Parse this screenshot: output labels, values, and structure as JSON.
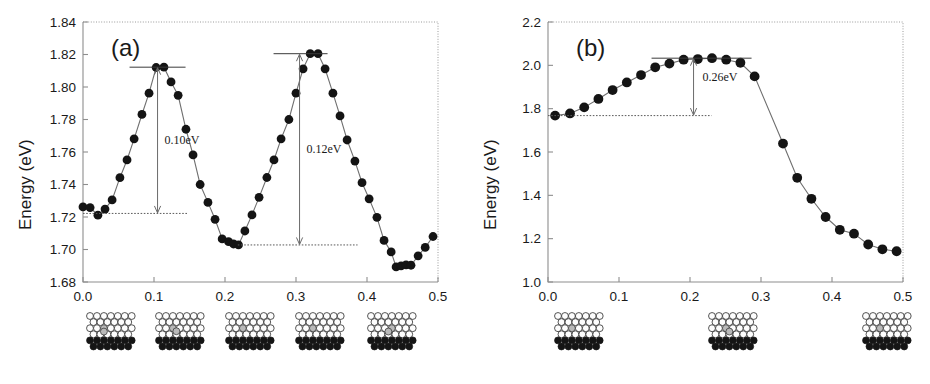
{
  "figure": {
    "panel_count": 2
  },
  "panels": {
    "a": {
      "tag": "(a)",
      "ylabel": "Energy (eV)",
      "xlabel": "",
      "yticks": [
        "1.68",
        "1.70",
        "1.72",
        "1.74",
        "1.76",
        "1.78",
        "1.80",
        "1.82",
        "1.84"
      ],
      "xticks": [
        "0.0",
        "0.1",
        "0.2",
        "0.3",
        "0.4",
        "0.5"
      ],
      "annotations": [
        {
          "label": "0.10eV",
          "x": 0.105,
          "top": 1.8122,
          "bottom": 1.7222
        },
        {
          "label": "0.12eV",
          "x": 0.305,
          "top": 1.8205,
          "bottom": 1.7028
        }
      ],
      "inset_count": 5,
      "inset_labels": [
        "structure-0.00",
        "structure-0.11",
        "structure-0.22",
        "structure-0.33",
        "structure-0.46"
      ]
    },
    "b": {
      "tag": "(b)",
      "ylabel": "Energy (eV)",
      "xlabel": "",
      "yticks": [
        "1.0",
        "1.2",
        "1.4",
        "1.6",
        "1.8",
        "2.0",
        "2.2"
      ],
      "xticks": [
        "0.0",
        "0.1",
        "0.2",
        "0.3",
        "0.4",
        "0.5"
      ],
      "annotations": [
        {
          "label": "0.26eV",
          "x": 0.205,
          "top": 2.033,
          "bottom": 1.768
        }
      ],
      "inset_count": 3,
      "inset_labels": [
        "structure-0.01",
        "structure-0.21",
        "structure-0.49"
      ]
    }
  },
  "colors": {
    "marker": "#141414",
    "curve": "#6f6f6f",
    "frame": "#8e8e8e",
    "text": "#1a1a1a",
    "atom_top": "#fdfdfd",
    "atom_bottom": "#151515",
    "atom_highlight": "#b9b9b9"
  },
  "chart_data": [
    {
      "type": "scatter",
      "panel": "a",
      "title": "(a)",
      "xlabel": "",
      "ylabel": "Energy (eV)",
      "xlim": [
        0.0,
        0.5
      ],
      "ylim": [
        1.68,
        1.84
      ],
      "xticks": [
        0.0,
        0.1,
        0.2,
        0.3,
        0.4,
        0.5
      ],
      "yticks": [
        1.68,
        1.7,
        1.72,
        1.74,
        1.76,
        1.78,
        1.8,
        1.82,
        1.84
      ],
      "grid": false,
      "legend": "none",
      "markers": "filled-circle",
      "connected": true,
      "x": [
        0.0,
        0.01,
        0.021,
        0.031,
        0.041,
        0.052,
        0.062,
        0.072,
        0.083,
        0.093,
        0.103,
        0.114,
        0.124,
        0.134,
        0.145,
        0.155,
        0.165,
        0.176,
        0.186,
        0.196,
        0.205,
        0.212,
        0.219,
        0.228,
        0.238,
        0.248,
        0.259,
        0.269,
        0.279,
        0.29,
        0.3,
        0.31,
        0.32,
        0.331,
        0.341,
        0.352,
        0.362,
        0.372,
        0.383,
        0.393,
        0.403,
        0.414,
        0.424,
        0.434,
        0.441,
        0.448,
        0.455,
        0.462,
        0.472,
        0.482,
        0.493
      ],
      "y": [
        1.7262,
        1.7258,
        1.7211,
        1.7249,
        1.7305,
        1.7442,
        1.7551,
        1.7681,
        1.7831,
        1.7962,
        1.812,
        1.8122,
        1.8031,
        1.7949,
        1.774,
        1.7582,
        1.74,
        1.729,
        1.7186,
        1.7065,
        1.7048,
        1.7034,
        1.7028,
        1.7114,
        1.7213,
        1.7321,
        1.7443,
        1.7551,
        1.7681,
        1.78,
        1.7962,
        1.8112,
        1.8205,
        1.8205,
        1.8112,
        1.7962,
        1.7822,
        1.7674,
        1.7544,
        1.7411,
        1.7312,
        1.7198,
        1.7056,
        1.6985,
        1.6893,
        1.6899,
        1.6905,
        1.6903,
        1.6961,
        1.7013,
        1.708
      ],
      "annotations": [
        {
          "text": "0.10eV",
          "barrier": 0.1,
          "from": 1.7222,
          "to": 1.8122
        },
        {
          "text": "0.12eV",
          "barrier": 0.12,
          "from": 1.7028,
          "to": 1.8205
        }
      ]
    },
    {
      "type": "scatter",
      "panel": "b",
      "title": "(b)",
      "xlabel": "",
      "ylabel": "Energy (eV)",
      "xlim": [
        0.0,
        0.5
      ],
      "ylim": [
        1.0,
        2.2
      ],
      "xticks": [
        0.0,
        0.1,
        0.2,
        0.3,
        0.4,
        0.5
      ],
      "yticks": [
        1.0,
        1.2,
        1.4,
        1.6,
        1.8,
        2.0,
        2.2
      ],
      "grid": false,
      "legend": "none",
      "markers": "filled-circle",
      "connected": true,
      "x": [
        0.01,
        0.031,
        0.051,
        0.071,
        0.091,
        0.111,
        0.131,
        0.151,
        0.171,
        0.191,
        0.211,
        0.231,
        0.251,
        0.271,
        0.291,
        0.331,
        0.351,
        0.371,
        0.391,
        0.411,
        0.431,
        0.451,
        0.471,
        0.491
      ],
      "y": [
        1.768,
        1.778,
        1.806,
        1.845,
        1.886,
        1.921,
        1.955,
        1.991,
        2.008,
        2.026,
        2.029,
        2.033,
        2.026,
        2.012,
        1.949,
        1.639,
        1.481,
        1.384,
        1.3,
        1.241,
        1.223,
        1.173,
        1.151,
        1.142
      ],
      "annotations": [
        {
          "text": "0.26eV",
          "barrier": 0.26,
          "from": 1.768,
          "to": 2.033
        }
      ]
    }
  ]
}
